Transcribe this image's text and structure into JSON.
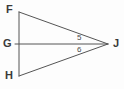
{
  "figure": {
    "background_color": "#fdfdfd",
    "stroke_color": "#555555",
    "stroke_width": 1,
    "label_color": "#3a3a3a",
    "canvas": {
      "width": 124,
      "height": 89
    },
    "vertices": [
      {
        "id": "F",
        "label": "F",
        "x": 19,
        "y": 12
      },
      {
        "id": "G",
        "label": "G",
        "x": 19,
        "y": 44
      },
      {
        "id": "H",
        "label": "H",
        "x": 19,
        "y": 76
      },
      {
        "id": "J",
        "label": "J",
        "x": 108,
        "y": 44
      }
    ],
    "segments": [
      {
        "id": "FH",
        "from": "F",
        "to": "H",
        "x1": 19,
        "y1": 12,
        "x2": 19,
        "y2": 76
      },
      {
        "id": "FJ",
        "from": "F",
        "to": "J",
        "x1": 19,
        "y1": 12,
        "x2": 108,
        "y2": 44
      },
      {
        "id": "HJ",
        "from": "H",
        "to": "J",
        "x1": 19,
        "y1": 76,
        "x2": 108,
        "y2": 44
      },
      {
        "id": "GJ",
        "from": "G",
        "to": "J",
        "x1": 15,
        "y1": 44,
        "x2": 108,
        "y2": 44
      }
    ],
    "angle_labels": [
      {
        "id": "angle-5",
        "label": "5",
        "at_vertex": "J",
        "between": "FJ and GJ",
        "x": 80,
        "y": 38
      },
      {
        "id": "angle-6",
        "label": "6",
        "at_vertex": "J",
        "between": "GJ and HJ",
        "x": 80,
        "y": 50
      }
    ]
  }
}
